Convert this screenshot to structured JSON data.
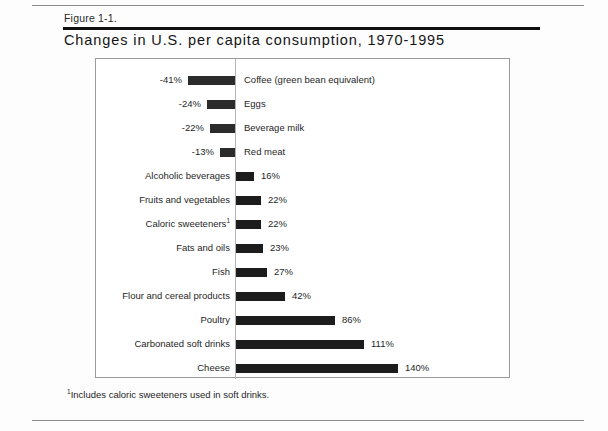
{
  "figure": {
    "label": "Figure 1-1.",
    "title": "Changes in U.S. per capita consumption, 1970-1995",
    "footnote_marker": "1",
    "footnote_text": "Includes caloric sweeteners used in soft drinks."
  },
  "chart_data": {
    "type": "bar",
    "orientation": "horizontal",
    "title": "Changes in U.S. per capita consumption, 1970-1995",
    "xlabel": "",
    "ylabel": "",
    "xlim": [
      -41,
      140
    ],
    "grid": false,
    "legend": null,
    "zero_axis": true,
    "units": "percent change",
    "categories": [
      "Coffee (green bean equivalent)",
      "Eggs",
      "Beverage milk",
      "Red meat",
      "Alcoholic beverages",
      "Fruits and vegetables",
      "Caloric sweeteners",
      "Fats and oils",
      "Fish",
      "Flour and cereal products",
      "Poultry",
      "Carbonated soft drinks",
      "Cheese"
    ],
    "values": [
      -41,
      -24,
      -22,
      -13,
      16,
      22,
      22,
      23,
      27,
      42,
      86,
      111,
      140
    ],
    "data_labels": [
      "-41%",
      "-24%",
      "-22%",
      "-13%",
      "16%",
      "22%",
      "22%",
      "23%",
      "27%",
      "42%",
      "86%",
      "111%",
      "140%"
    ],
    "bars": [
      {
        "category": "Coffee (green bean equivalent)",
        "category_display": "Coffee (green bean equivalent)",
        "value": -41,
        "label": "-41%",
        "footnote": false
      },
      {
        "category": "Eggs",
        "category_display": "Eggs",
        "value": -24,
        "label": "-24%",
        "footnote": false
      },
      {
        "category": "Beverage milk",
        "category_display": "Beverage milk",
        "value": -22,
        "label": "-22%",
        "footnote": false
      },
      {
        "category": "Red meat",
        "category_display": "Red meat",
        "value": -13,
        "label": "-13%",
        "footnote": false
      },
      {
        "category": "Alcoholic beverages",
        "category_display": "Alcoholic beverages",
        "value": 16,
        "label": "16%",
        "footnote": false
      },
      {
        "category": "Fruits and vegetables",
        "category_display": "Fruits and vegetables",
        "value": 22,
        "label": "22%",
        "footnote": false
      },
      {
        "category": "Caloric sweeteners",
        "category_display": "Caloric sweeteners",
        "value": 22,
        "label": "22%",
        "footnote": true
      },
      {
        "category": "Fats and oils",
        "category_display": "Fats and oils",
        "value": 23,
        "label": "23%",
        "footnote": false
      },
      {
        "category": "Fish",
        "category_display": "Fish",
        "value": 27,
        "label": "27%",
        "footnote": false
      },
      {
        "category": "Flour and cereal products",
        "category_display": "Flour and cereal products",
        "value": 42,
        "label": "42%",
        "footnote": false
      },
      {
        "category": "Poultry",
        "category_display": "Poultry",
        "value": 86,
        "label": "86%",
        "footnote": false
      },
      {
        "category": "Carbonated soft drinks",
        "category_display": "Carbonated soft drinks",
        "value": 111,
        "label": "111%",
        "footnote": false
      },
      {
        "category": "Cheese",
        "category_display": "Cheese",
        "value": 140,
        "label": "140%",
        "footnote": false
      }
    ]
  },
  "colors": {
    "bar": "#1c1c1c",
    "axis": "#b4b4b4",
    "frame": "#9a9a9a",
    "rule": "#101010",
    "text": "#1f1f1f"
  }
}
